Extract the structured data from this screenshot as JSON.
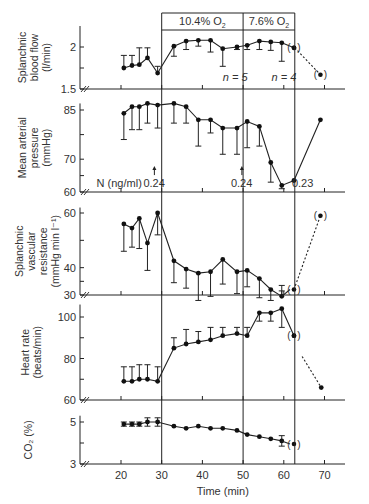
{
  "chart_data": {
    "type": "line",
    "xlabel": "Time (min)",
    "x_ticks": [
      20,
      30,
      40,
      50,
      60,
      70
    ],
    "xlim": [
      13,
      76
    ],
    "phase_boxes": [
      {
        "label": "10.4% O",
        "sub": "2",
        "x_start": 30,
        "x_end": 50
      },
      {
        "label": "7.6% O",
        "sub": "2",
        "x_start": 50,
        "x_end": 62.7
      }
    ],
    "vertical_lines": [
      30,
      50,
      62.7
    ],
    "panels": [
      {
        "id": "splanchnic-blood-flow",
        "ylabel": [
          "Splanchnic",
          "blood flow",
          "(l/min)"
        ],
        "yticks": [
          1.5,
          2.0
        ],
        "minor_ticks": [
          1.75
        ],
        "ylim": [
          1.5,
          2.25
        ],
        "annotations": [
          {
            "text": "n = 5",
            "x": 45,
            "y": 1.6
          },
          {
            "text": "n = 4",
            "x": 57,
            "y": 1.6
          }
        ],
        "series": {
          "x": [
            20.7,
            22.7,
            24.5,
            26.5,
            29,
            33,
            36,
            39,
            42,
            45,
            48.5,
            51,
            54,
            56.8,
            59.5,
            62.5
          ],
          "y": [
            1.75,
            1.78,
            1.79,
            1.87,
            1.69,
            2.01,
            2.07,
            2.08,
            2.08,
            1.98,
            2.0,
            2.02,
            2.07,
            2.06,
            2.05,
            1.99
          ],
          "err_up": [
            0.15,
            0.12,
            0.2,
            0.12,
            0,
            0,
            0,
            0,
            0,
            0,
            0,
            0,
            0,
            0,
            0,
            0
          ],
          "err_down": [
            0,
            0,
            0,
            0,
            -0.08,
            0.12,
            0.1,
            0.07,
            0.14,
            0.21,
            0.03,
            0.05,
            0.1,
            0.1,
            0.22,
            0
          ]
        },
        "dashed": {
          "x": [
            62.7,
            69
          ],
          "y": [
            1.99,
            1.67
          ]
        }
      },
      {
        "id": "mean-arterial-pressure",
        "ylabel": [
          "Mean arterial",
          "pressure",
          "(mmHg)"
        ],
        "yticks": [
          60,
          70,
          85
        ],
        "minor_ticks": [
          65,
          77.5
        ],
        "ylim": [
          60,
          87
        ],
        "annotations": [
          {
            "text": "N (ng/ml)",
            "x": 14,
            "y": 61.5
          },
          {
            "text": "0.24",
            "x": 25.5,
            "y": 61.5,
            "arrow": true
          },
          {
            "text": "0.24",
            "x": 47,
            "y": 61.5,
            "arrow": true
          },
          {
            "text": "0.23",
            "x": 62,
            "y": 61.5
          }
        ],
        "series": {
          "x": [
            20.7,
            22.7,
            24.5,
            26.5,
            29,
            33,
            36,
            39,
            42,
            45,
            48.5,
            51,
            54,
            56.8,
            59.5,
            62.5,
            69
          ],
          "y": [
            84,
            86,
            86,
            87,
            86.5,
            87,
            86,
            82,
            82,
            79.5,
            79.5,
            81.5,
            80,
            69,
            62,
            63.5,
            82
          ],
          "err_down": [
            8,
            7,
            7,
            6,
            7,
            6,
            5,
            8,
            4,
            8,
            8,
            8,
            6,
            6,
            1,
            0,
            0
          ]
        },
        "dashed": null
      },
      {
        "id": "splanchnic-vascular-resistance",
        "ylabel": [
          "Splanchnic",
          "vascular",
          "resistance",
          "(mmHg min l⁻¹)"
        ],
        "yticks": [
          30,
          40,
          60
        ],
        "minor_ticks": [
          35,
          50
        ],
        "ylim": [
          30,
          62
        ],
        "series": {
          "x": [
            20.7,
            22.7,
            24.5,
            26.5,
            29,
            33,
            36,
            39,
            42,
            45,
            48.5,
            51,
            54,
            56.8,
            59.5
          ],
          "y": [
            56,
            54.5,
            58,
            49,
            60,
            42.5,
            39.5,
            38,
            38.5,
            43,
            38.5,
            39,
            36,
            32,
            29.5
          ],
          "err_down": [
            10,
            7,
            11,
            10,
            8,
            8,
            7,
            10,
            9,
            9,
            8,
            6,
            7,
            4,
            -2
          ],
          "err_up": [
            0,
            0,
            0,
            0,
            0,
            0,
            0,
            0,
            0,
            0,
            0,
            0,
            0,
            0,
            4
          ]
        },
        "bracket_points": [
          {
            "x": 62.5,
            "y": 32
          },
          {
            "x": 69,
            "y": 59
          }
        ],
        "dashed": {
          "x": [
            62.5,
            69
          ],
          "y": [
            32,
            59
          ]
        }
      },
      {
        "id": "heart-rate",
        "ylabel": [
          "Heart rate",
          "(beats/min)"
        ],
        "yticks": [
          60,
          80,
          100
        ],
        "minor_ticks": [
          70,
          90
        ],
        "ylim": [
          60,
          106
        ],
        "series": {
          "x": [
            20.7,
            22.7,
            24.5,
            26.5,
            29,
            33,
            36,
            39,
            42,
            45,
            48.5,
            51,
            54,
            56.8,
            59.5,
            62.5
          ],
          "y": [
            69,
            69,
            70,
            70,
            69,
            85,
            87,
            88,
            89,
            91,
            92,
            91,
            102,
            102,
            104,
            91
          ],
          "err_up": [
            7,
            7,
            7,
            7,
            7,
            5,
            7,
            5,
            6,
            4,
            3,
            4,
            0,
            0,
            0,
            0
          ],
          "err_down": [
            0,
            0,
            0,
            0,
            0,
            0,
            0,
            0,
            0,
            0,
            0,
            0,
            4,
            4,
            9,
            0
          ]
        },
        "bracket_points": [
          {
            "x": 62.5,
            "y": 91
          }
        ],
        "dashed": {
          "x": [
            64.5,
            69.2
          ],
          "y": [
            81,
            66
          ]
        },
        "end_point": {
          "x": 69.2,
          "y": 66
        }
      },
      {
        "id": "co2",
        "ylabel": [
          "CO₂ (%)"
        ],
        "yticks": [
          3,
          5
        ],
        "minor_ticks": [
          4
        ],
        "ylim": [
          3,
          5.3
        ],
        "series": {
          "x": [
            20.7,
            22.7,
            24.5,
            26.5,
            29,
            33,
            36,
            39,
            42,
            45,
            48.5,
            51,
            54,
            56.8,
            59.5
          ],
          "y": [
            4.9,
            4.9,
            4.9,
            5.0,
            5.0,
            4.8,
            4.7,
            4.8,
            4.7,
            4.7,
            4.6,
            4.4,
            4.3,
            4.2,
            4.1
          ],
          "err_sym": [
            0.1,
            0.1,
            0.1,
            0.2,
            0.2,
            0,
            0,
            0,
            0,
            0,
            0,
            0,
            0,
            0,
            0.25
          ]
        },
        "bracket_points": [
          {
            "x": 62.5,
            "y": 3.95
          }
        ],
        "dashed": null
      }
    ]
  }
}
